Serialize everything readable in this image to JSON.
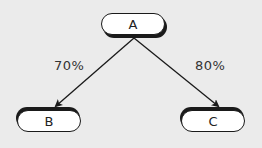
{
  "diagram": {
    "type": "tree",
    "background": "#ebebeb",
    "nodes": [
      {
        "id": "A",
        "label": "A"
      },
      {
        "id": "B",
        "label": "B"
      },
      {
        "id": "C",
        "label": "C"
      }
    ],
    "edges": [
      {
        "from": "A",
        "to": "B",
        "label": "70%"
      },
      {
        "from": "A",
        "to": "C",
        "label": "80%"
      }
    ]
  }
}
